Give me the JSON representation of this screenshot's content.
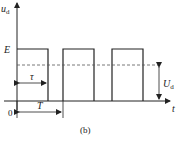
{
  "diagram": {
    "type": "pwm-waveform",
    "y_axis_label": "u",
    "y_axis_label_sub": "d",
    "x_axis_label": "t",
    "origin_label": "0",
    "level_label": "E",
    "pulse_width_label": "τ",
    "period_label": "T",
    "average_label": "U",
    "average_label_sub": "d",
    "caption": "(b)",
    "pulses": 3,
    "colors": {
      "stroke": "#222222",
      "dashed": "#555555",
      "background": "#ffffff"
    }
  }
}
